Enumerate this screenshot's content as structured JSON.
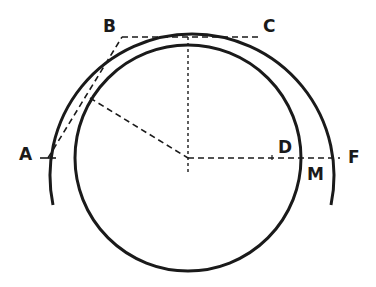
{
  "diagram": {
    "labels": {
      "A": "A",
      "B": "B",
      "C": "C",
      "D": "D",
      "F": "F",
      "M": "M"
    },
    "colors": {
      "stroke": "#1a1a1a",
      "background": "#ffffff"
    }
  }
}
